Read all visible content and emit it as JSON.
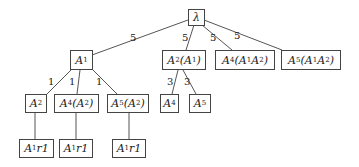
{
  "diagram": {
    "type": "tree",
    "nodes": [
      {
        "id": "root",
        "html": "λ",
        "x": 188,
        "y": 9,
        "w": 17,
        "h": 17
      },
      {
        "id": "a1",
        "html": "A<sub>1</sub>",
        "x": 70,
        "y": 50,
        "w": 23,
        "h": 20
      },
      {
        "id": "a2a1",
        "html": "A<sub>2</sub>(A<sub>1</sub>)",
        "x": 162,
        "y": 50,
        "w": 44,
        "h": 20
      },
      {
        "id": "a4a1a2",
        "html": "A<sub>4</sub>(A<sub>1</sub>A<sub>2</sub>)",
        "x": 215,
        "y": 50,
        "w": 60,
        "h": 20
      },
      {
        "id": "a5a1a2",
        "html": "A<sub>5</sub>(A<sub>1</sub>A<sub>2</sub>)",
        "x": 281,
        "y": 50,
        "w": 60,
        "h": 20
      },
      {
        "id": "a2",
        "html": "A<sub>2</sub>",
        "x": 25,
        "y": 94,
        "w": 22,
        "h": 19
      },
      {
        "id": "a4a2",
        "html": "A<sub>4</sub>(A<sub>2</sub>)",
        "x": 54,
        "y": 94,
        "w": 45,
        "h": 19
      },
      {
        "id": "a5a2",
        "html": "A<sub>5</sub>(A<sub>2</sub>)",
        "x": 107,
        "y": 94,
        "w": 42,
        "h": 19
      },
      {
        "id": "a4",
        "html": "A<sub>4</sub>",
        "x": 160,
        "y": 94,
        "w": 19,
        "h": 19
      },
      {
        "id": "a5",
        "html": "A<sub>5</sub>",
        "x": 189,
        "y": 94,
        "w": 22,
        "h": 19
      },
      {
        "id": "r1a",
        "html": "A<sub>1</sub>r1",
        "x": 19,
        "y": 139,
        "w": 35,
        "h": 19
      },
      {
        "id": "r1b",
        "html": "A<sub>1</sub>r1",
        "x": 59,
        "y": 139,
        "w": 34,
        "h": 19
      },
      {
        "id": "r1c",
        "html": "A<sub>1</sub>r1",
        "x": 112,
        "y": 139,
        "w": 34,
        "h": 19
      }
    ],
    "edges": [
      {
        "from": "root",
        "to": "a1",
        "x1": 188,
        "y1": 20,
        "x2": 92,
        "y2": 55,
        "label": "5",
        "lx": 130,
        "ly": 33
      },
      {
        "from": "root",
        "to": "a2a1",
        "x1": 194,
        "y1": 25,
        "x2": 186,
        "y2": 50,
        "label": "5",
        "lx": 182,
        "ly": 33
      },
      {
        "from": "root",
        "to": "a4a1a2",
        "x1": 202,
        "y1": 25,
        "x2": 232,
        "y2": 50,
        "label": "5",
        "lx": 210,
        "ly": 33
      },
      {
        "from": "root",
        "to": "a5a1a2",
        "x1": 204,
        "y1": 20,
        "x2": 282,
        "y2": 50,
        "label": "5",
        "lx": 234,
        "ly": 31
      },
      {
        "from": "a1",
        "to": "a2",
        "x1": 72,
        "y1": 69,
        "x2": 47,
        "y2": 94,
        "label": "1",
        "lx": 48,
        "ly": 77
      },
      {
        "from": "a1",
        "to": "a4a2",
        "x1": 80,
        "y1": 70,
        "x2": 77,
        "y2": 94,
        "label": "1",
        "lx": 69,
        "ly": 77
      },
      {
        "from": "a1",
        "to": "a5a2",
        "x1": 92,
        "y1": 69,
        "x2": 117,
        "y2": 94,
        "label": "1",
        "lx": 96,
        "ly": 77
      },
      {
        "from": "a2a1",
        "to": "a4",
        "x1": 178,
        "y1": 70,
        "x2": 172,
        "y2": 94,
        "label": "3",
        "lx": 167,
        "ly": 77
      },
      {
        "from": "a2a1",
        "to": "a5",
        "x1": 183,
        "y1": 70,
        "x2": 196,
        "y2": 94,
        "label": "3",
        "lx": 184,
        "ly": 77
      },
      {
        "from": "a2",
        "to": "r1a",
        "x1": 35,
        "y1": 113,
        "x2": 35,
        "y2": 139,
        "label": ""
      },
      {
        "from": "a4a2",
        "to": "r1b",
        "x1": 76,
        "y1": 113,
        "x2": 76,
        "y2": 139,
        "label": ""
      },
      {
        "from": "a5a2",
        "to": "r1c",
        "x1": 129,
        "y1": 113,
        "x2": 129,
        "y2": 139,
        "label": ""
      }
    ]
  }
}
